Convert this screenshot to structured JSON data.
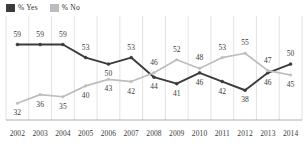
{
  "legend": {
    "items": [
      {
        "label": "% Yes",
        "color": "#3b3b3b",
        "name": "legend-yes"
      },
      {
        "label": "% No",
        "color": "#bdbdbd",
        "name": "legend-no"
      }
    ]
  },
  "colors": {
    "yes_line": "#3b3b3b",
    "no_line": "#bdbdbd",
    "gridline": "#d6d6d6",
    "axis": "#9a9a9a",
    "label_text": "#3a3a3a"
  },
  "chart_data": {
    "type": "line",
    "title": "",
    "xlabel": "",
    "ylabel": "",
    "ylim": [
      28,
      62
    ],
    "grid": "vertical",
    "legend_position": "top-left",
    "categories": [
      "2002",
      "2003",
      "2004",
      "2005",
      "2006",
      "2007",
      "2008",
      "2009",
      "2010",
      "2011",
      "2012",
      "2013",
      "2014"
    ],
    "series": [
      {
        "name": "% Yes",
        "color": "#3b3b3b",
        "values": [
          59,
          59,
          59,
          53,
          50,
          53,
          44,
          41,
          46,
          42,
          38,
          46,
          50
        ],
        "label_offsets": [
          "above",
          "above",
          "above",
          "above",
          "below",
          "above",
          "below",
          "below",
          "below",
          "below",
          "below",
          "below",
          "above"
        ]
      },
      {
        "name": "% No",
        "color": "#bdbdbd",
        "values": [
          32,
          36,
          35,
          40,
          43,
          42,
          46,
          52,
          48,
          53,
          55,
          47,
          45
        ],
        "label_offsets": [
          "below",
          "below",
          "below",
          "below",
          "below",
          "below",
          "above",
          "above",
          "above",
          "above",
          "above",
          "above",
          "below"
        ]
      }
    ]
  }
}
